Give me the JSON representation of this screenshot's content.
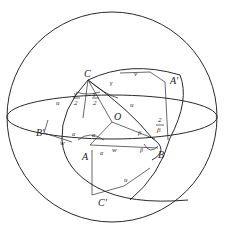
{
  "diagram": {
    "points": {
      "C": "C",
      "A": "A",
      "B": "B",
      "O": "O",
      "A_prime": "A′",
      "B_prime": "B′",
      "C_prime": "C′"
    },
    "arc_labels": {
      "u": "u",
      "v": "v",
      "w": "w"
    },
    "angle_labels": {
      "gamma_half_num": "γ",
      "gamma_half_den": "2",
      "alpha_half_num": "α",
      "alpha_half_den": "2",
      "beta_half_num": "β",
      "beta_half_den": "2"
    }
  }
}
